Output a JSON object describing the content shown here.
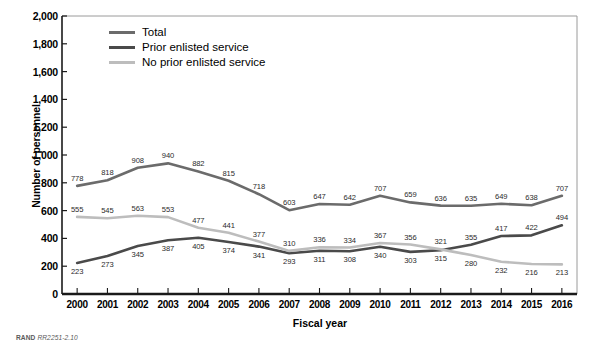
{
  "figure": {
    "source_prefix": "RAND",
    "source_id": "RR2251-2.10"
  },
  "axes": {
    "y_title": "Number of personnel",
    "x_title": "Fiscal year",
    "y_ticks": [
      "2,000",
      "1,800",
      "1,600",
      "1,400",
      "1,200",
      "1,000",
      "800",
      "600",
      "400",
      "200",
      "0"
    ]
  },
  "legend": {
    "items": [
      {
        "label": "Total",
        "color": "#6b6b6b"
      },
      {
        "label": "Prior enlisted service",
        "color": "#4a4a4a"
      },
      {
        "label": "No prior enlisted service",
        "color": "#bdbdbd"
      }
    ]
  },
  "chart_data": {
    "type": "line",
    "title": "",
    "xlabel": "Fiscal year",
    "ylabel": "Number of personnel",
    "ylim": [
      0,
      2000
    ],
    "ytick_step": 200,
    "grid": false,
    "legend_position": "top-left-inside",
    "categories": [
      "2000",
      "2001",
      "2002",
      "2003",
      "2004",
      "2005",
      "2006",
      "2007",
      "2008",
      "2009",
      "2010",
      "2011",
      "2012",
      "2013",
      "2014",
      "2015",
      "2016"
    ],
    "series": [
      {
        "name": "Total",
        "color": "#6b6b6b",
        "values": [
          778,
          818,
          908,
          940,
          882,
          815,
          718,
          603,
          647,
          642,
          707,
          659,
          636,
          635,
          649,
          638,
          707
        ]
      },
      {
        "name": "Prior enlisted service",
        "color": "#4a4a4a",
        "values": [
          223,
          273,
          345,
          387,
          405,
          374,
          341,
          293,
          311,
          308,
          340,
          303,
          315,
          355,
          417,
          422,
          494
        ]
      },
      {
        "name": "No prior enlisted service",
        "color": "#bdbdbd",
        "values": [
          555,
          545,
          563,
          553,
          477,
          441,
          377,
          310,
          336,
          334,
          367,
          356,
          321,
          280,
          232,
          216,
          213
        ]
      }
    ]
  }
}
